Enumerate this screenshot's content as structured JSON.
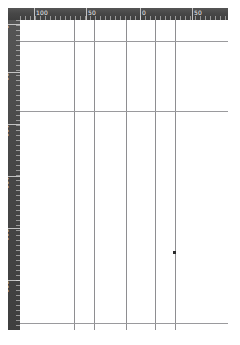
{
  "app": {
    "title": "Layout Canvas",
    "background_color": "#ffffff",
    "ruler_color": "#4a4a4a",
    "ruler_text_color": "#eeeeee",
    "guide_color": "#8e8e91",
    "marker_color": "#2b2b2b"
  },
  "ruler_top": {
    "name": "horizontal-ruler",
    "unit": "mm",
    "labels": [
      {
        "text": "100",
        "x": 14
      },
      {
        "text": "50",
        "x": 66
      },
      {
        "text": "0",
        "x": 120
      },
      {
        "text": "50",
        "x": 172
      }
    ],
    "major_ticks": [
      14,
      66,
      120,
      172
    ],
    "minor_tick_spacing": 5
  },
  "ruler_left": {
    "name": "vertical-ruler",
    "unit": "mm",
    "labels": [
      {
        "text": "0",
        "y": 4
      },
      {
        "text": "50",
        "y": 52
      },
      {
        "text": "100",
        "y": 104
      },
      {
        "text": "150",
        "y": 156
      },
      {
        "text": "200",
        "y": 208
      },
      {
        "text": "250",
        "y": 260
      }
    ],
    "major_ticks": [
      4,
      52,
      104,
      156,
      208,
      260
    ],
    "minor_tick_spacing": 5
  },
  "ruler_corner": {
    "name": "ruler-corner-box",
    "label": ""
  },
  "canvas": {
    "name": "page-canvas",
    "width": 208,
    "height": 310,
    "guides_vertical": [
      54,
      74,
      106,
      135,
      155
    ],
    "guides_horizontal": [
      21,
      91,
      303
    ],
    "markers": [
      {
        "x": 153,
        "y": 231
      }
    ]
  }
}
